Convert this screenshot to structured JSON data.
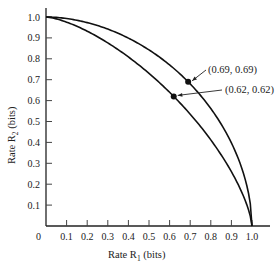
{
  "chart_data": {
    "type": "line",
    "title": "",
    "xlabel": "Rate R1 (bits)",
    "ylabel": "Rate R2 (bits)",
    "xlim": [
      0,
      1.0
    ],
    "ylim": [
      0,
      1.0
    ],
    "grid": false,
    "legend": null,
    "x_ticks": [
      "0",
      "0.1",
      "0.2",
      "0.3",
      "0.4",
      "0.5",
      "0.6",
      "0.7",
      "0.8",
      "0.9",
      "1.0"
    ],
    "y_ticks": [
      "0.1",
      "0.2",
      "0.3",
      "0.4",
      "0.5",
      "0.6",
      "0.7",
      "0.8",
      "0.9",
      "1.0"
    ],
    "series": [
      {
        "name": "outer boundary",
        "description": "curve from (0,1.0) to (1.0,0) passing through (0.69,0.69)",
        "points": [
          [
            0,
            1.0
          ],
          [
            0.69,
            0.69
          ],
          [
            1.0,
            0
          ]
        ]
      },
      {
        "name": "inner boundary",
        "description": "curve from (0,1.0) to (1.0,0) passing through (0.62,0.62)",
        "points": [
          [
            0,
            1.0
          ],
          [
            0.62,
            0.62
          ],
          [
            1.0,
            0
          ]
        ]
      }
    ],
    "annotations": [
      {
        "text": "(0.69, 0.69)",
        "x": 0.69,
        "y": 0.69
      },
      {
        "text": "(0.62, 0.62)",
        "x": 0.62,
        "y": 0.62
      }
    ]
  },
  "labels": {
    "xlabel_prefix": "Rate R",
    "xlabel_sub": "1",
    "xlabel_suffix": " (bits)",
    "ylabel_prefix": "Rate R",
    "ylabel_sub": "2",
    "ylabel_suffix": " (bits)",
    "annot_outer": "(0.69, 0.69)",
    "annot_inner": "(0.62, 0.62)",
    "origin": "0"
  }
}
